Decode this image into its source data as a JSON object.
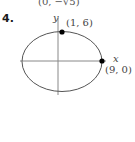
{
  "previous_problem": {
    "point_label": "(0, −√5)"
  },
  "problem": {
    "number": "4.",
    "figure": {
      "type": "ellipse",
      "axes": {
        "x_label": "x",
        "y_label": "y"
      },
      "points": [
        {
          "label": "(1, 6)",
          "position": "top"
        },
        {
          "label": "(9, 0)",
          "position": "right"
        }
      ],
      "colors": {
        "curve": "#555555",
        "axes": "#888888",
        "points": "#000000"
      }
    }
  }
}
